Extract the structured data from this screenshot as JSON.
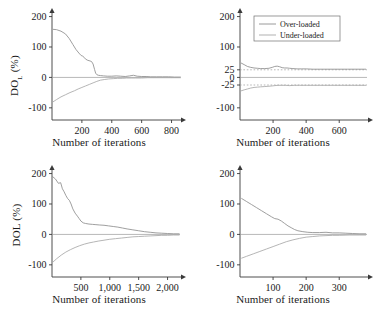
{
  "figure": {
    "layout": "2x2 grid of convergence plots",
    "legend": {
      "position": "top-right panel, upper area",
      "entries": [
        {
          "label": "Over-loaded",
          "color": "#8e8e8e"
        },
        {
          "label": "Under-loaded",
          "color": "#a8a8a8"
        }
      ]
    }
  },
  "chart_data": [
    {
      "id": "top-left",
      "type": "line",
      "title": "",
      "xlabel": "Number of iterations",
      "ylabel": "DO",
      "ylabel_sub": "L",
      "ylabel_unit": "(%)",
      "ylabel_full": "DO_L (%)",
      "xlim": [
        0,
        870
      ],
      "ylim": [
        -140,
        215
      ],
      "xticks": [
        200,
        400,
        600,
        800
      ],
      "xticklabels": [
        "200",
        "400",
        "600",
        "800"
      ],
      "yticks": [
        200,
        100,
        0,
        -100
      ],
      "yticklabels": [
        "200",
        "100",
        "0",
        "-100"
      ],
      "grid": false,
      "reference_lines": [
        0
      ],
      "series": [
        {
          "name": "Over-loaded",
          "color": "#8e8e8e",
          "x": [
            8,
            30,
            60,
            90,
            115,
            140,
            160,
            180,
            195,
            205,
            215,
            225,
            240,
            255,
            265,
            275,
            285,
            292,
            300,
            310,
            325,
            345,
            370,
            400,
            430,
            460,
            490,
            520,
            545,
            570,
            600,
            630,
            660,
            700,
            740,
            780,
            820,
            860
          ],
          "y": [
            158,
            157,
            152,
            143,
            128,
            108,
            92,
            80,
            72,
            70,
            66,
            60,
            56,
            54,
            52,
            44,
            26,
            14,
            9,
            7,
            6,
            5,
            4,
            4,
            5,
            4,
            3,
            5,
            7,
            4,
            3,
            3,
            2,
            2,
            2,
            2,
            1,
            1
          ]
        },
        {
          "name": "Under-loaded",
          "color": "#a8a8a8",
          "x": [
            8,
            30,
            60,
            90,
            120,
            150,
            175,
            200,
            225,
            250,
            275,
            300,
            325,
            350,
            380,
            410,
            440,
            470,
            500,
            530,
            560,
            600,
            640,
            680,
            720,
            760,
            800,
            860
          ],
          "y": [
            -80,
            -73,
            -64,
            -57,
            -50,
            -44,
            -38,
            -33,
            -28,
            -23,
            -18,
            -13,
            -9,
            -7,
            -5,
            -4,
            -3,
            -3,
            -2,
            -2,
            -2,
            -2,
            -1,
            -1,
            -1,
            -1,
            -1,
            -1
          ]
        }
      ]
    },
    {
      "id": "top-right",
      "type": "line",
      "title": "",
      "xlabel": "Number of iterations",
      "ylabel": "",
      "xlim": [
        0,
        780
      ],
      "ylim": [
        -140,
        215
      ],
      "xticks": [
        200,
        400,
        600
      ],
      "xticklabels": [
        "200",
        "400",
        "600"
      ],
      "yticks": [
        200,
        100,
        25,
        0,
        -25,
        -100
      ],
      "yticklabels": [
        "200",
        "100",
        "25",
        "0",
        "-25",
        "-100"
      ],
      "grid": false,
      "reference_lines": [
        25,
        0,
        -25
      ],
      "series": [
        {
          "name": "Over-loaded",
          "color": "#8e8e8e",
          "x": [
            8,
            25,
            45,
            65,
            85,
            105,
            125,
            150,
            175,
            195,
            210,
            225,
            240,
            255,
            270,
            285,
            300,
            320,
            345,
            370,
            400,
            440,
            480,
            520,
            560,
            600,
            650,
            700,
            760
          ],
          "y": [
            47,
            42,
            36,
            33,
            31,
            30,
            29,
            29,
            30,
            33,
            36,
            37,
            35,
            32,
            31,
            31,
            30,
            29,
            28,
            28,
            28,
            27,
            27,
            27,
            27,
            27,
            27,
            27,
            27
          ]
        },
        {
          "name": "Under-loaded",
          "color": "#a8a8a8",
          "x": [
            8,
            25,
            45,
            65,
            85,
            105,
            125,
            150,
            175,
            195,
            210,
            230,
            250,
            275,
            300,
            330,
            360,
            400,
            440,
            480,
            520,
            560,
            620,
            680,
            760
          ],
          "y": [
            -44,
            -41,
            -38,
            -35,
            -33,
            -32,
            -31,
            -30,
            -29,
            -28,
            -27,
            -26,
            -26,
            -26,
            -27,
            -26,
            -26,
            -26,
            -26,
            -26,
            -26,
            -26,
            -26,
            -26,
            -26
          ]
        }
      ]
    },
    {
      "id": "bottom-left",
      "type": "line",
      "title": "",
      "xlabel": "Number of iterations",
      "ylabel": "DOL (%)",
      "xlim": [
        0,
        2250
      ],
      "ylim": [
        -140,
        215
      ],
      "xticks": [
        500,
        1000,
        1500,
        2000
      ],
      "xticklabels": [
        "500",
        "1,000",
        "1,500",
        "2,000"
      ],
      "yticks": [
        200,
        100,
        0,
        -100
      ],
      "yticklabels": [
        "200",
        "100",
        "0",
        "-100"
      ],
      "grid": false,
      "reference_lines": [
        0
      ],
      "series": [
        {
          "name": "Over-loaded",
          "color": "#8e8e8e",
          "x": [
            10,
            60,
            110,
            150,
            180,
            210,
            240,
            270,
            300,
            330,
            360,
            400,
            440,
            470,
            500,
            540,
            580,
            640,
            700,
            760,
            820,
            900,
            980,
            1060,
            1140,
            1220,
            1300,
            1400,
            1500,
            1600,
            1700,
            1800,
            1900,
            2000,
            2100,
            2200
          ],
          "y": [
            190,
            182,
            168,
            170,
            150,
            140,
            128,
            118,
            112,
            100,
            84,
            70,
            60,
            52,
            44,
            38,
            36,
            34,
            33,
            32,
            31,
            30,
            28,
            26,
            24,
            21,
            18,
            15,
            12,
            9,
            7,
            5,
            4,
            3,
            2,
            2
          ]
        },
        {
          "name": "Under-loaded",
          "color": "#a8a8a8",
          "x": [
            10,
            80,
            160,
            240,
            320,
            400,
            480,
            560,
            640,
            720,
            800,
            900,
            1000,
            1100,
            1200,
            1300,
            1400,
            1500,
            1600,
            1700,
            1800,
            1900,
            2000,
            2100,
            2200
          ],
          "y": [
            -92,
            -80,
            -68,
            -58,
            -50,
            -43,
            -37,
            -32,
            -28,
            -25,
            -22,
            -19,
            -16,
            -14,
            -12,
            -10,
            -8,
            -7,
            -6,
            -5,
            -4,
            -3,
            -3,
            -2,
            -2
          ]
        }
      ]
    },
    {
      "id": "bottom-right",
      "type": "line",
      "title": "",
      "xlabel": "Number of iterations",
      "ylabel": "",
      "xlim": [
        0,
        390
      ],
      "ylim": [
        -140,
        215
      ],
      "xticks": [
        100,
        200,
        300
      ],
      "xticklabels": [
        "100",
        "200",
        "300"
      ],
      "yticks": [
        200,
        100,
        0,
        -100
      ],
      "yticklabels": [
        "200",
        "100",
        "0",
        "-100"
      ],
      "grid": false,
      "reference_lines": [
        0
      ],
      "series": [
        {
          "name": "Over-loaded",
          "color": "#8e8e8e",
          "x": [
            5,
            20,
            35,
            50,
            65,
            80,
            95,
            105,
            115,
            125,
            135,
            145,
            155,
            165,
            175,
            190,
            205,
            220,
            240,
            260,
            280,
            300,
            320,
            340,
            360,
            380
          ],
          "y": [
            118,
            108,
            98,
            88,
            78,
            68,
            58,
            52,
            50,
            44,
            36,
            28,
            22,
            16,
            12,
            9,
            7,
            6,
            6,
            7,
            5,
            5,
            4,
            3,
            2,
            2
          ]
        },
        {
          "name": "Under-loaded",
          "color": "#a8a8a8",
          "x": [
            5,
            20,
            40,
            60,
            80,
            100,
            120,
            140,
            160,
            180,
            200,
            220,
            240,
            260,
            280,
            300,
            330,
            360,
            380
          ],
          "y": [
            -78,
            -72,
            -64,
            -56,
            -48,
            -40,
            -32,
            -24,
            -18,
            -13,
            -9,
            -7,
            -5,
            -4,
            -3,
            -3,
            -2,
            -2,
            -2
          ]
        }
      ]
    }
  ]
}
